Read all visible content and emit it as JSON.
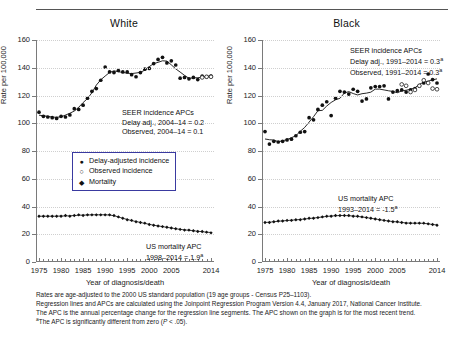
{
  "figure": {
    "ylabel": "Rate per 100,000",
    "xlabel": "Year of diagnosis/death",
    "y_ticks": [
      0,
      20,
      40,
      60,
      80,
      100,
      120,
      140,
      160
    ],
    "x_ticks_major": [
      1975,
      1980,
      1985,
      1990,
      1995,
      2000,
      2005,
      2014
    ],
    "x_range": [
      1975,
      2014
    ],
    "y_range": [
      0,
      160
    ]
  },
  "legend": {
    "items": [
      {
        "marker": "filled-circle",
        "label": "Delay-adjusted incidence"
      },
      {
        "marker": "open-circle",
        "label": "Observed incidence"
      },
      {
        "marker": "filled-diamond",
        "label": "Mortality"
      }
    ]
  },
  "panels": [
    {
      "title": "White",
      "incidence_annotation": [
        "SEER incidence APCs",
        "Delay adj., 2004–14 = 0.2",
        "Observed, 2004–14 = 0.1"
      ],
      "mortality_annotation": [
        "US mortality APC",
        "1998–2014 = 1.9"
      ],
      "mortality_annotation_sup": "a"
    },
    {
      "title": "Black",
      "incidence_annotation": [
        "SEER incidence APCs",
        "Delay adj., 1991–2014 = 0.3",
        "Observed, 1991–2014 = 0.3"
      ],
      "incidence_annotation_sup": "a",
      "mortality_annotation": [
        "US mortality APC",
        "1993–2014 = -1.5"
      ],
      "mortality_annotation_sup": "a"
    }
  ],
  "footnotes": [
    "Rates are age-adjusted to the 2000 US standard population (19 age groups - Census P25–1103).",
    "Regression lines and APCs are calculated using the Joinpoint Regression Program Version 4.4, January 2017, National Cancer Institute.",
    "The APC is the annual percentage change for the regression line segments. The APC shown on the graph is for the most recent trend."
  ],
  "footnote_sig": {
    "sup": "a",
    "pre": "The APC is significantly different from zero (",
    "ital": "P",
    "post": " < .05)."
  },
  "chart_data": {
    "type": "scatter",
    "xlabel": "Year of diagnosis/death",
    "ylabel": "Rate per 100,000",
    "xlim": [
      1975,
      2014
    ],
    "ylim": [
      0,
      160
    ],
    "grid": true,
    "legend_position": "inside-left-middle",
    "years": [
      1975,
      1976,
      1977,
      1978,
      1979,
      1980,
      1981,
      1982,
      1983,
      1984,
      1985,
      1986,
      1987,
      1988,
      1989,
      1990,
      1991,
      1992,
      1993,
      1994,
      1995,
      1996,
      1997,
      1998,
      1999,
      2000,
      2001,
      2002,
      2003,
      2004,
      2005,
      2006,
      2007,
      2008,
      2009,
      2010,
      2011,
      2012,
      2013,
      2014
    ],
    "panels": [
      {
        "name": "White",
        "series": [
          {
            "name": "Delay-adjusted incidence",
            "marker": "filled-circle",
            "values": [
              108,
              105,
              104.5,
              104,
              103.5,
              105,
              104.5,
              106,
              110.5,
              110,
              113,
              118,
              123,
              125,
              131,
              140.5,
              137,
              136.5,
              138,
              137,
              137,
              135,
              133.5,
              136.5,
              139,
              139.5,
              143,
              146,
              147.5,
              143.5,
              145,
              142,
              132.5,
              133,
              132,
              133,
              131.5,
              134,
              133.5,
              134,
              135.5
            ]
          },
          {
            "name": "Observed incidence",
            "marker": "open-circle",
            "values": [
              null,
              null,
              null,
              null,
              null,
              null,
              null,
              null,
              null,
              null,
              null,
              null,
              null,
              null,
              null,
              null,
              null,
              null,
              null,
              null,
              null,
              null,
              null,
              null,
              null,
              null,
              null,
              null,
              null,
              null,
              null,
              null,
              null,
              null,
              null,
              null,
              null,
              133,
              133.5,
              133.5
            ]
          },
          {
            "name": "Mortality",
            "marker": "filled-diamond",
            "values": [
              33,
              33,
              33,
              33,
              33,
              33,
              33.5,
              33,
              33.5,
              34,
              33.5,
              34,
              34,
              34,
              34,
              34,
              34,
              33.5,
              32.5,
              31.5,
              30.5,
              30,
              29,
              28.5,
              28,
              27,
              26.5,
              26,
              25.5,
              25,
              24.5,
              24,
              23.5,
              23,
              23,
              22.5,
              22,
              22,
              21.5,
              21
            ]
          }
        ],
        "regression_incidence_recent_apc": 0.2,
        "regression_observed_recent_apc": 0.1,
        "regression_mortality_recent_apc": 1.9,
        "regression_mortality_segment": "1998–2014"
      },
      {
        "name": "Black",
        "series": [
          {
            "name": "Delay-adjusted incidence",
            "marker": "filled-circle",
            "values": [
              94,
              85,
              87,
              86.5,
              87,
              88,
              88.5,
              91,
              93.5,
              94,
              104,
              102.5,
              110,
              113,
              115.5,
              105.5,
              118,
              123,
              122.5,
              121,
              124.5,
              123,
              116,
              117.5,
              125.5,
              126.5,
              126.5,
              127,
              117.5,
              122.5,
              123.5,
              124,
              122.5,
              124,
              125,
              127,
              129,
              135.5,
              131.5,
              129
            ]
          },
          {
            "name": "Observed incidence",
            "marker": "open-circle",
            "values": [
              null,
              null,
              null,
              null,
              null,
              null,
              null,
              null,
              null,
              null,
              null,
              null,
              null,
              null,
              null,
              null,
              null,
              null,
              null,
              null,
              null,
              null,
              null,
              null,
              null,
              null,
              null,
              null,
              null,
              null,
              null,
              128,
              127,
              122.5,
              124,
              127,
              131,
              129,
              125,
              124.5
            ]
          },
          {
            "name": "Mortality",
            "marker": "filled-diamond",
            "values": [
              28.5,
              28.5,
              29,
              29.5,
              29.5,
              30,
              30,
              30.5,
              30.5,
              31,
              31.5,
              31.5,
              32,
              32.5,
              33,
              33,
              33.5,
              33.5,
              33.5,
              33.5,
              33,
              33,
              32.5,
              32,
              31.5,
              31,
              30.5,
              30,
              29.5,
              29,
              29,
              28.5,
              28,
              28,
              28,
              28,
              28,
              27.5,
              27,
              26.5
            ]
          }
        ],
        "regression_incidence_recent_apc": 0.3,
        "regression_observed_recent_apc": 0.3,
        "regression_mortality_recent_apc": -1.5,
        "regression_mortality_segment": "1993–2014"
      }
    ]
  }
}
